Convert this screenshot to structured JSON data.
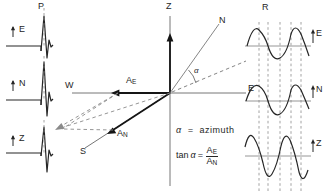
{
  "figure": {
    "type": "seismology-diagram"
  },
  "panels": {
    "left": {
      "title": "P",
      "title_name": "p-wave-panel-label",
      "traces": [
        {
          "component": "E",
          "polarity": "up"
        },
        {
          "component": "N",
          "polarity": "up"
        },
        {
          "component": "Z",
          "polarity": "up"
        }
      ]
    },
    "center": {
      "axes": [
        {
          "label": "Z",
          "direction": "up"
        },
        {
          "label": "W",
          "direction": "left"
        },
        {
          "label": "S",
          "direction": "down-left"
        },
        {
          "label": "N",
          "direction": "up-right"
        },
        {
          "label": "E",
          "direction": "right"
        }
      ],
      "vectors": [
        {
          "label": "A",
          "sub": "E",
          "direction": "left"
        },
        {
          "label": "A",
          "sub": "N",
          "direction": "down-left"
        }
      ],
      "angle_symbol": "α"
    },
    "right": {
      "title": "R",
      "title_name": "r-wave-panel-label",
      "traces": [
        {
          "component": "E",
          "polarity": "up"
        },
        {
          "component": "N",
          "polarity": "up"
        },
        {
          "component": "Z",
          "polarity": "up"
        }
      ]
    }
  },
  "equations": {
    "azimuth_symbol": "α",
    "azimuth_equals": "=",
    "azimuth_value": "azimuth",
    "tan_prefix": "tan",
    "tan_symbol": "α",
    "tan_equals": "=",
    "tan_numerator": "A",
    "tan_numerator_sub": "E",
    "tan_denominator": "A",
    "tan_denominator_sub": "N"
  },
  "colors": {
    "ink": "#262626",
    "axis": "#555555",
    "dash": "#777777"
  }
}
